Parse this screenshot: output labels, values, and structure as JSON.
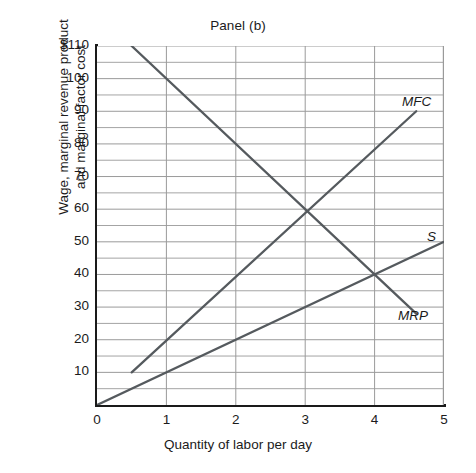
{
  "chart_data": {
    "type": "line",
    "title": "Panel (b)",
    "xlabel": "Quantity of labor per day",
    "ylabel": "Wage, marginal revenue product and marginal factor cost",
    "ylabel_line1": "Wage, marginal revenue product",
    "ylabel_line2": "and marginal factor cost",
    "xlim": [
      0,
      5
    ],
    "ylim": [
      0,
      110
    ],
    "xticks": [
      "0",
      "1",
      "2",
      "3",
      "4",
      "5"
    ],
    "xtick_values": [
      0,
      1,
      2,
      3,
      4,
      5
    ],
    "yticks": [
      "10",
      "20",
      "30",
      "40",
      "50",
      "60",
      "70",
      "80",
      "90",
      "100",
      "$110"
    ],
    "ytick_values": [
      10,
      20,
      30,
      40,
      50,
      60,
      70,
      80,
      90,
      100,
      110
    ],
    "grid": "horizontal gridlines every 5 units; vertical gridlines at each integer quantity",
    "grid_minor_step_y": 5,
    "grid_step_x": 1,
    "legend_position": "inline curve labels at right end of each line",
    "series": [
      {
        "name": "MRP",
        "label": "MRP",
        "description": "Marginal revenue product, downward sloping",
        "points": [
          [
            0.5,
            110
          ],
          [
            4.6,
            28
          ]
        ],
        "slope": -20,
        "color": "#555a5e"
      },
      {
        "name": "MFC",
        "label": "MFC",
        "description": "Marginal factor cost, upward sloping, steeper",
        "points": [
          [
            0.5,
            10
          ],
          [
            4.6,
            90
          ]
        ],
        "slope": 19.5,
        "color": "#555a5e"
      },
      {
        "name": "S",
        "label": "S",
        "description": "Labor supply curve, upward sloping from origin",
        "points": [
          [
            0,
            0
          ],
          [
            5,
            50
          ]
        ],
        "slope": 10,
        "color": "#555a5e"
      }
    ],
    "annotations": [
      {
        "text": "MFC",
        "x": 4.6,
        "y": 92,
        "style": "italic"
      },
      {
        "text": "S",
        "x": 5.0,
        "y": 52,
        "style": "italic"
      },
      {
        "text": "MRP",
        "x": 4.6,
        "y": 26,
        "style": "italic"
      }
    ],
    "intersections": [
      {
        "series": [
          "MFC",
          "MRP"
        ],
        "x": 3,
        "y": 60
      },
      {
        "series": [
          "S",
          "MRP"
        ],
        "x": 4,
        "y": 40
      }
    ],
    "colors": {
      "line": "#555a5e",
      "axis": "#1a1a1a",
      "grid": "#9a9a9a",
      "text": "#1b1b1b",
      "background": "#ffffff"
    }
  }
}
